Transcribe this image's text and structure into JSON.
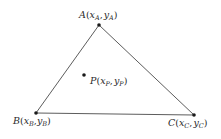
{
  "diagram": {
    "type": "triangle-with-interior-point",
    "stroke_color": "#4a4a4a",
    "point_color": "#1a1a1a",
    "vertices": [
      {
        "id": "A",
        "name": "A",
        "x_sub": "A",
        "y_sub": "A",
        "pos": [
          99,
          25
        ]
      },
      {
        "id": "B",
        "name": "B",
        "x_sub": "B",
        "y_sub": "B",
        "pos": [
          36,
          113
        ]
      },
      {
        "id": "C",
        "name": "C",
        "x_sub": "C",
        "y_sub": "C",
        "pos": [
          194,
          115
        ]
      }
    ],
    "interior_point": {
      "id": "P",
      "name": "P",
      "x_sub": "P",
      "y_sub": "P",
      "pos": [
        84,
        75
      ]
    },
    "labels": {
      "A": {
        "letter": "A",
        "open": "(",
        "x": "x",
        "xs": "A",
        "comma": ",",
        "y": "y",
        "ys": "A",
        "close": ")"
      },
      "B": {
        "letter": "B",
        "open": "(",
        "x": "x",
        "xs": "B",
        "comma": ",",
        "y": "y",
        "ys": "B",
        "close": ")"
      },
      "C": {
        "letter": "C",
        "open": "(",
        "x": "x",
        "xs": "C",
        "comma": ",",
        "y": "y",
        "ys": "C",
        "close": ")"
      },
      "P": {
        "letter": "P",
        "open": "(",
        "x": "x",
        "xs": "P",
        "comma": ",",
        "y": "y",
        "ys": "P",
        "close": ")"
      }
    }
  }
}
